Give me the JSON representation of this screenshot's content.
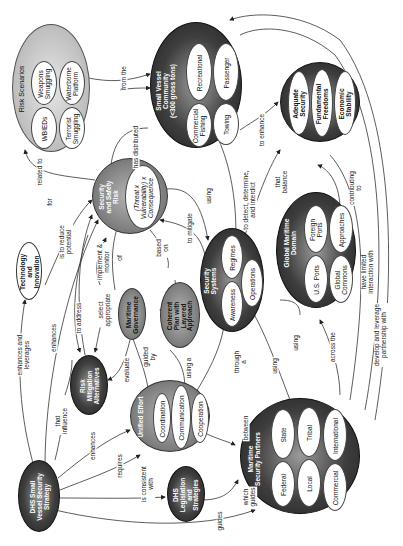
{
  "nodes": {
    "dhs_strategy": {
      "label": "DHS Small\nVessel Security\nStrategy"
    },
    "risk_scenarios": {
      "label": "Risk Scenarios",
      "items": [
        "Weapons\nSmuggling",
        "Waterborne\nPlatform",
        "WBIEDs",
        "Terrorist\nSmuggling"
      ]
    },
    "small_vessel_community": {
      "label": "Small Vessel\nCommunity\n(<300 gross tons)",
      "items": [
        "Recreational",
        "Passenger",
        "Commercial\nFishing",
        "Towing"
      ]
    },
    "balance_goals": {
      "items": [
        "Adequate\nSecurity",
        "Fundamental\nFreedoms",
        "Economic\nStability"
      ]
    },
    "security_safety_risk": {
      "label": "Security\nand Safety\nRisk",
      "formula": "(Threat x\nVulnerability) x\nConsequence"
    },
    "technology_innovation": {
      "label": "Technology\nand\nInnovation"
    },
    "security_systems": {
      "label": "Security\nSystems",
      "items": [
        "Regimes",
        "Awareness",
        "Operations"
      ]
    },
    "global_maritime_domain": {
      "label": "Global Maritime\nDomain",
      "items": [
        "Foreign\nPorts",
        "Approaches",
        "U.S. Ports",
        "Global\nCommons"
      ]
    },
    "maritime_governance": {
      "label": "Maritime\nGovernance"
    },
    "coherent_plan": {
      "label": "Coherent\nPlan with\nLayered\nApproach"
    },
    "risk_mitigation": {
      "label": "Risk\nMitigation\nAlternatives"
    },
    "unified_effort": {
      "label": "Unified Effort",
      "items": [
        "Coordination",
        "Communication",
        "Cooperation"
      ]
    },
    "dhs_legislation": {
      "label": "DHS\nLegislation\nand\nStrategies"
    },
    "maritime_partners": {
      "label": "Maritime\nSecurity Partners",
      "items": [
        "State",
        "Tribal",
        "International",
        "Federal",
        "Local",
        "Commercial"
      ]
    }
  },
  "links": {
    "from_the": "from the",
    "has_distributed": "has distributed",
    "related_to": "related to",
    "for": "for",
    "to_enhance": "to enhance",
    "that_balance": "that\nbalance",
    "contributing_to": "contributing\nto",
    "using_top": "using",
    "detect": "to detect, determine,\nand interdict",
    "to_mitigate": "to mitigate",
    "based_on": "based\non",
    "of": "of",
    "implement_monitor": "implement &\nmonitor",
    "is_to_reduce": "is to reduce\npotential",
    "to_address": "to address",
    "select_appropriate": "select\nappropriate",
    "enhances_and_leverages": "enhances and\nleverages",
    "enhances_top": "enhances",
    "evaluate": "evaluate",
    "guided_by": "guided\nby",
    "using_a": "using a",
    "through_a": "through\na",
    "using_mid": "using",
    "using_gmd": "using",
    "across_the": "across the",
    "have_limited": "have limited\ninteraction with",
    "develop_leverage": "develop and leverage\npartnership with",
    "that_influence": "that\ninfluence",
    "enhances_low": "enhances",
    "requires": "requires",
    "is_consistent": "is consistent\nwith",
    "between": "between",
    "which_guides": "which\nguides",
    "guides": "guides"
  }
}
